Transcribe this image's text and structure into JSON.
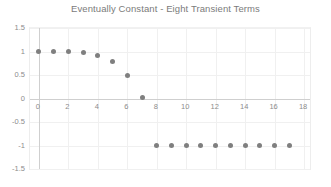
{
  "chart_data": {
    "type": "scatter",
    "title": "Eventually Constant - Eight Transient Terms",
    "xlabel": "",
    "ylabel": "",
    "xlim": [
      -0.6,
      18.4
    ],
    "ylim": [
      -1.5,
      1.5
    ],
    "xticks": [
      0,
      2,
      4,
      6,
      8,
      10,
      12,
      14,
      16,
      18
    ],
    "xtick_labels": [
      "0",
      "2",
      "4",
      "6",
      "8",
      "10",
      "12",
      "14",
      "16",
      "18"
    ],
    "yticks": [
      1.5,
      1,
      0.5,
      0,
      -0.5,
      -1,
      -1.5
    ],
    "ytick_labels": [
      "1.5",
      "1",
      "0.5",
      "0",
      "-0.5",
      "-1",
      "-1.5"
    ],
    "grid": true,
    "legend": false,
    "marker_color": "#7f7f7f",
    "series": [
      {
        "name": "sequence",
        "x": [
          0,
          1,
          2,
          3,
          4,
          5,
          6,
          7,
          8,
          9,
          10,
          11,
          12,
          13,
          14,
          15,
          16,
          17
        ],
        "values": [
          1,
          1,
          1,
          0.97,
          0.92,
          0.78,
          0.5,
          0.02,
          -1,
          -1,
          -1,
          -1,
          -1,
          -1,
          -1,
          -1,
          -1,
          -1
        ]
      }
    ]
  },
  "style": {
    "title_color": "#7b7b7b",
    "tick_color": "#8c8c8c",
    "grid_color": "#f0f0f0",
    "axis_color": "#cfcfcf",
    "background": "#ffffff"
  }
}
